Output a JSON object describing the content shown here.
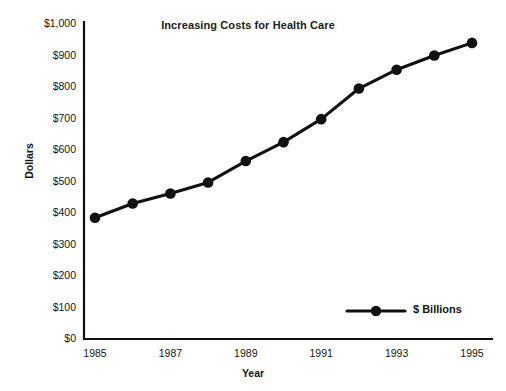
{
  "chart_data": {
    "type": "line",
    "title": "Increasing Costs for Health Care",
    "xlabel": "Year",
    "ylabel": "Dollars",
    "x": [
      1985,
      1986,
      1987,
      1988,
      1989,
      1990,
      1991,
      1992,
      1993,
      1994,
      1995
    ],
    "series": [
      {
        "name": "$ Billions",
        "values": [
          385,
          430,
          462,
          497,
          565,
          625,
          698,
          795,
          855,
          900,
          940
        ]
      }
    ],
    "xlim": [
      1985,
      1995
    ],
    "ylim": [
      0,
      1000
    ],
    "y_ticks": [
      0,
      100,
      200,
      300,
      400,
      500,
      600,
      700,
      800,
      900,
      1000
    ],
    "y_tick_labels": [
      "$0",
      "$100",
      "$200",
      "$300",
      "$400",
      "$500",
      "$600",
      "$700",
      "$800",
      "$900",
      "$1,000"
    ],
    "x_ticks": [
      1985,
      1987,
      1989,
      1991,
      1993,
      1995
    ],
    "x_tick_labels": [
      "1985",
      "1987",
      "1989",
      "1991",
      "1993",
      "1995"
    ],
    "grid": false,
    "legend_position": "bottom-right",
    "legend_entries": [
      "$ Billions"
    ],
    "series_color": "#111111",
    "axis_color": "#111111",
    "background_color": "#ffffff"
  }
}
